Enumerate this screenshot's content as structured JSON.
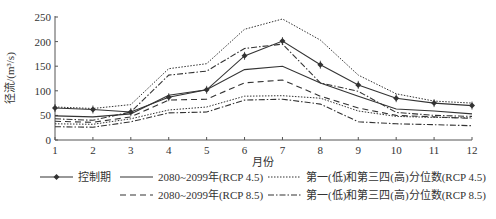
{
  "chart_data": {
    "type": "line",
    "title": "",
    "xlabel": "月份",
    "ylabel": "径流/(m³/s)",
    "ylim": [
      0,
      250
    ],
    "yticks": [
      0,
      50,
      100,
      150,
      200,
      250
    ],
    "x": [
      1,
      2,
      3,
      4,
      5,
      6,
      7,
      8,
      9,
      10,
      11,
      12
    ],
    "grid": false,
    "legend_position": "bottom",
    "series": [
      {
        "name": "控制期",
        "style": "solid-marker",
        "values": [
          65,
          62,
          57,
          87,
          102,
          171,
          201,
          153,
          112,
          85,
          75,
          70
        ]
      },
      {
        "name": "2080~2099年(RCP 4.5)",
        "style": "solid",
        "values": [
          49,
          47,
          53,
          91,
          102,
          143,
          150,
          116,
          89,
          63,
          59,
          53
        ]
      },
      {
        "name": "第一(低)和第三四(高)分位数(RCP 4.5) 上",
        "style": "dotted",
        "legend": false,
        "values": [
          67,
          64,
          72,
          145,
          155,
          225,
          246,
          203,
          132,
          94,
          79,
          75
        ]
      },
      {
        "name": "第一(低)和第三四(高)分位数(RCP 4.5) 下",
        "style": "dotted",
        "legend": false,
        "values": [
          33,
          32,
          43,
          61,
          67,
          89,
          90,
          85,
          59,
          48,
          46,
          45
        ]
      },
      {
        "name": "2080~2099年(RCP 8.5)",
        "style": "dashed",
        "values": [
          38,
          36,
          47,
          81,
          83,
          116,
          122,
          89,
          65,
          50,
          47,
          44
        ]
      },
      {
        "name": "第一(低)和第三四(高)分位数(RCP 8.5) 上",
        "style": "dashdot",
        "legend": false,
        "values": [
          43,
          40,
          57,
          132,
          140,
          186,
          195,
          116,
          99,
          56,
          50,
          48
        ]
      },
      {
        "name": "第一(低)和第三四(高)分位数(RCP 8.5) 下",
        "style": "dashdot",
        "legend": false,
        "values": [
          27,
          26,
          37,
          55,
          57,
          81,
          83,
          73,
          37,
          33,
          31,
          29
        ]
      }
    ]
  },
  "legend": {
    "items": [
      {
        "label": "控制期",
        "style": "solid-marker"
      },
      {
        "label": "2080~2099年(RCP 4.5)",
        "style": "solid"
      },
      {
        "label": "第一(低)和第三四(高)分位数(RCP 4.5)",
        "style": "dotted"
      },
      {
        "label": "2080~2099年(RCP 8.5)",
        "style": "dashed"
      },
      {
        "label": "第一(低)和第三四(高)分位数(RCP 8.5)",
        "style": "dashdot"
      }
    ]
  },
  "colors": {
    "line": "#333333",
    "axis": "#555555"
  }
}
